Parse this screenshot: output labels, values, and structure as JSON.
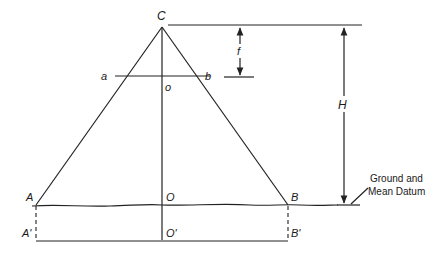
{
  "figure": {
    "type": "photogrammetry-vertical-photo-scale-diagram",
    "points": {
      "C": "C",
      "a": "a",
      "b": "b",
      "o": "o",
      "A": "A",
      "B": "B",
      "O": "O",
      "A_prime": "A'",
      "B_prime": "B'",
      "O_prime": "O'"
    },
    "dimensions": {
      "focal_length": "f",
      "flying_height": "H"
    },
    "annotation": {
      "line1": "Ground and",
      "line2": "Mean Datum"
    }
  }
}
